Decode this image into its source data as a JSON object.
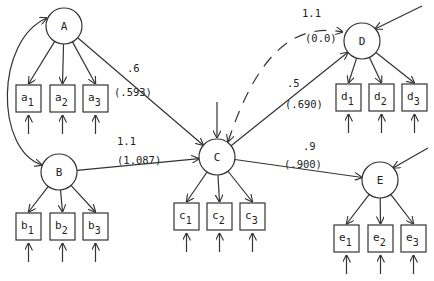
{
  "diagram": {
    "type": "structural-equation-path-diagram",
    "latent_nodes": [
      {
        "id": "A",
        "label": "A",
        "cx": 64,
        "cy": 26,
        "r": 18
      },
      {
        "id": "B",
        "label": "B",
        "cx": 59,
        "cy": 172,
        "r": 18
      },
      {
        "id": "C",
        "label": "C",
        "cx": 217,
        "cy": 157,
        "r": 18
      },
      {
        "id": "D",
        "label": "D",
        "cx": 362,
        "cy": 41,
        "r": 18
      },
      {
        "id": "E",
        "label": "E",
        "cx": 380,
        "cy": 180,
        "r": 18
      }
    ],
    "indicators": [
      {
        "id": "a1",
        "base": "a",
        "sub": "1",
        "x": 16,
        "y": 85,
        "w": 25,
        "h": 27,
        "parent": "A"
      },
      {
        "id": "a2",
        "base": "a",
        "sub": "2",
        "x": 50,
        "y": 85,
        "w": 25,
        "h": 27,
        "parent": "A"
      },
      {
        "id": "a3",
        "base": "a",
        "sub": "3",
        "x": 83,
        "y": 85,
        "w": 25,
        "h": 27,
        "parent": "A"
      },
      {
        "id": "b1",
        "base": "b",
        "sub": "1",
        "x": 16,
        "y": 213,
        "w": 25,
        "h": 27,
        "parent": "B"
      },
      {
        "id": "b2",
        "base": "b",
        "sub": "2",
        "x": 50,
        "y": 213,
        "w": 25,
        "h": 27,
        "parent": "B"
      },
      {
        "id": "b3",
        "base": "b",
        "sub": "3",
        "x": 83,
        "y": 213,
        "w": 25,
        "h": 27,
        "parent": "B"
      },
      {
        "id": "c1",
        "base": "c",
        "sub": "1",
        "x": 174,
        "y": 203,
        "w": 25,
        "h": 27,
        "parent": "C"
      },
      {
        "id": "c2",
        "base": "c",
        "sub": "2",
        "x": 207,
        "y": 203,
        "w": 25,
        "h": 27,
        "parent": "C"
      },
      {
        "id": "c3",
        "base": "c",
        "sub": "3",
        "x": 240,
        "y": 203,
        "w": 25,
        "h": 27,
        "parent": "C"
      },
      {
        "id": "d1",
        "base": "d",
        "sub": "1",
        "x": 336,
        "y": 84,
        "w": 25,
        "h": 27,
        "parent": "D"
      },
      {
        "id": "d2",
        "base": "d",
        "sub": "2",
        "x": 369,
        "y": 84,
        "w": 25,
        "h": 27,
        "parent": "D"
      },
      {
        "id": "d3",
        "base": "d",
        "sub": "3",
        "x": 402,
        "y": 84,
        "w": 25,
        "h": 27,
        "parent": "D"
      },
      {
        "id": "e1",
        "base": "e",
        "sub": "1",
        "x": 334,
        "y": 225,
        "w": 25,
        "h": 27,
        "parent": "E"
      },
      {
        "id": "e2",
        "base": "e",
        "sub": "2",
        "x": 368,
        "y": 225,
        "w": 25,
        "h": 27,
        "parent": "E"
      },
      {
        "id": "e3",
        "base": "e",
        "sub": "3",
        "x": 401,
        "y": 225,
        "w": 25,
        "h": 27,
        "parent": "E"
      }
    ],
    "paths": [
      {
        "from": "A",
        "to": "C",
        "coef": ".6",
        "estimate": "(.593)",
        "style": "solid"
      },
      {
        "from": "B",
        "to": "C",
        "coef": "1.1",
        "estimate": "(1.087)",
        "style": "solid"
      },
      {
        "from": "C",
        "to": "D",
        "coef": ".5",
        "estimate": "(.690)",
        "style": "solid"
      },
      {
        "from": "C",
        "to": "E",
        "coef": ".9",
        "estimate": "(.900)",
        "style": "solid"
      },
      {
        "from": "C",
        "to": "D",
        "coef": "1.1",
        "estimate": "(0.0)",
        "style": "dashed",
        "bidirectional": true
      },
      {
        "from": "A",
        "to": "B",
        "coef": "",
        "estimate": "",
        "style": "solid",
        "bidirectional": true,
        "curved": true
      }
    ],
    "coef_labels": {
      "ac": {
        "coef": ".6",
        "estimate": "(.593)"
      },
      "bc": {
        "coef": "1.1",
        "estimate": "(1.087)"
      },
      "cd": {
        "coef": ".5",
        "estimate": "(.690)"
      },
      "ce": {
        "coef": ".9",
        "estimate": "(.900)"
      },
      "cd_dashed": {
        "coef": "1.1",
        "estimate": "(0.0)"
      }
    },
    "colors": {
      "stroke": "#333333",
      "text": "#222222",
      "background": "#ffffff"
    }
  }
}
